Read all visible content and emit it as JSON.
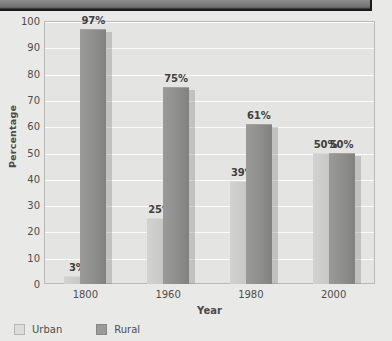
{
  "header": {
    "title": ""
  },
  "chart_data": {
    "type": "bar",
    "title": "",
    "xlabel": "Year",
    "ylabel": "Percentage",
    "categories": [
      "1800",
      "1960",
      "1980",
      "2000"
    ],
    "series": [
      {
        "name": "Urban",
        "color": "#c9c9c7",
        "values": [
          3,
          25,
          39,
          50
        ],
        "labels": [
          "3%",
          "25%",
          "39%",
          "50%"
        ]
      },
      {
        "name": "Rural",
        "color": "#8e8e8c",
        "values": [
          97,
          75,
          61,
          50
        ],
        "labels": [
          "97%",
          "75%",
          "61%",
          "50%"
        ]
      }
    ],
    "ylim": [
      0,
      100
    ],
    "yticks": [
      0,
      10,
      20,
      30,
      40,
      50,
      60,
      70,
      80,
      90,
      100
    ],
    "ytick_labels": [
      "0",
      "10",
      "20",
      "30",
      "40",
      "50",
      "60",
      "70",
      "80",
      "90",
      "100"
    ],
    "grid": true,
    "legend_position": "bottom-left"
  },
  "legend": {
    "entries": [
      {
        "label": "Urban"
      },
      {
        "label": "Rural"
      }
    ]
  }
}
